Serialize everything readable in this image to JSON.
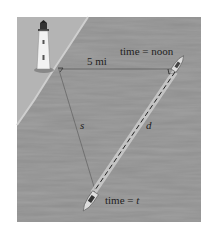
{
  "figure": {
    "labels": {
      "distance": "5 mi",
      "time_noon": "time = noon",
      "time_t_prefix": "time = ",
      "time_t_var": "t",
      "side_s": "s",
      "side_d": "d"
    },
    "colors": {
      "sea": "#8f8f8f",
      "land": "#b8b8b8",
      "line": "#444444",
      "dashed": "#222222"
    },
    "elements": [
      "lighthouse",
      "boat-noon",
      "boat-time-t",
      "right-angle-marker"
    ]
  }
}
